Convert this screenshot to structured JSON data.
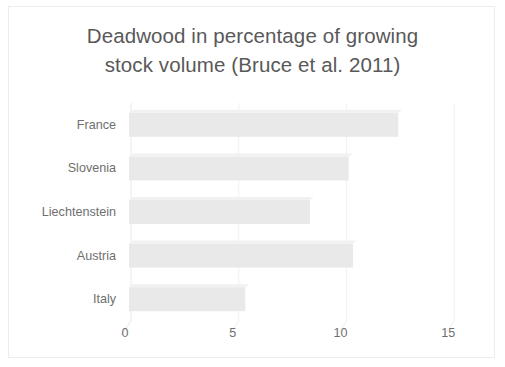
{
  "chart_data": {
    "type": "bar",
    "orientation": "horizontal",
    "title": "Deadwood in percentage of growing stock volume (Bruce et al. 2011)",
    "title_lines": [
      "Deadwood in percentage of growing",
      "stock volume (Bruce et al. 2011)"
    ],
    "categories": [
      "France",
      "Slovenia",
      "Liechtenstein",
      "Austria",
      "Italy"
    ],
    "values": [
      12.4,
      10.1,
      8.3,
      10.3,
      5.3
    ],
    "xlabel": "",
    "ylabel": "",
    "xlim": [
      0,
      16.8
    ],
    "xticks": [
      0,
      5,
      10,
      15
    ],
    "xtick_labels": [
      "0",
      "5",
      "10",
      "15"
    ],
    "grid": "vertical-only",
    "legend": "none",
    "style_3d": true,
    "bar_color": "#e9e9e9",
    "grid_color": "#f2f2f2",
    "axis_color": "#f0f0f0",
    "text_color": "#6f6f6f",
    "title_color": "#595959",
    "border_color": "#eceded",
    "background": "#ffffff"
  }
}
